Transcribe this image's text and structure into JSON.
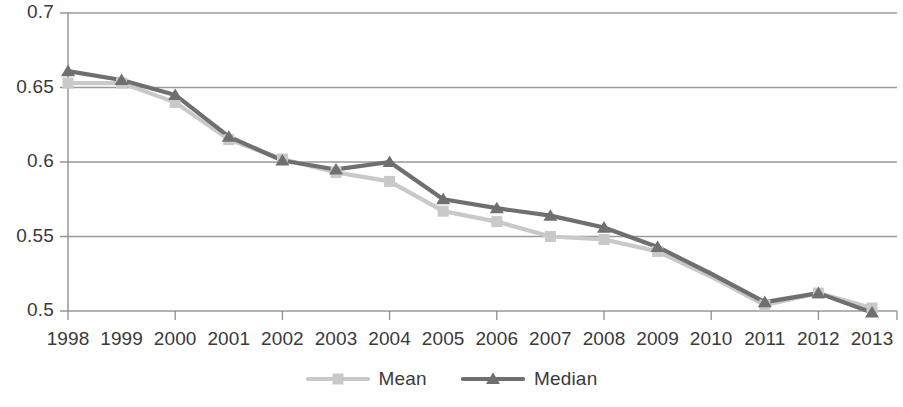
{
  "chart_data": {
    "type": "line",
    "title": "",
    "subtitle": "",
    "xlabel": "",
    "ylabel": "",
    "categories": [
      "1998",
      "1999",
      "2000",
      "2001",
      "2002",
      "2003",
      "2004",
      "2005",
      "2006",
      "2007",
      "2008",
      "2009",
      "2010",
      "2011",
      "2012",
      "2013"
    ],
    "ylim": [
      0.5,
      0.7
    ],
    "ytick_labels": [
      "0.7",
      "0.65",
      "0.6",
      "0.55",
      "0.5"
    ],
    "ytick_values": [
      0.7,
      0.65,
      0.6,
      0.55,
      0.5
    ],
    "grid": true,
    "grid_axis": "y",
    "legend_position": "bottom-center",
    "series": [
      {
        "name": "Mean",
        "color": "#c9c9c9",
        "marker": "square",
        "values": [
          0.653,
          0.653,
          0.64,
          0.615,
          0.602,
          0.593,
          0.587,
          0.567,
          0.56,
          0.55,
          0.548,
          0.54,
          0.523,
          0.504,
          0.512,
          0.502
        ],
        "markers_hidden_at": [
          "2010"
        ]
      },
      {
        "name": "Median",
        "color": "#6f6f6f",
        "marker": "triangle",
        "values": [
          0.661,
          0.655,
          0.645,
          0.617,
          0.601,
          0.595,
          0.6,
          0.575,
          0.569,
          0.564,
          0.556,
          0.543,
          0.525,
          0.506,
          0.512,
          0.499
        ],
        "markers_hidden_at": [
          "2010"
        ]
      }
    ]
  },
  "axis": {
    "y_labels": [
      "0.7",
      "0.65",
      "0.6",
      "0.55",
      "0.5"
    ],
    "x_labels": [
      "1998",
      "1999",
      "2000",
      "2001",
      "2002",
      "2003",
      "2004",
      "2005",
      "2006",
      "2007",
      "2008",
      "2009",
      "2010",
      "2011",
      "2012",
      "2013"
    ]
  },
  "legend": {
    "items": [
      {
        "label": "Mean",
        "color": "#c9c9c9",
        "marker": "square"
      },
      {
        "label": "Median",
        "color": "#6f6f6f",
        "marker": "triangle"
      }
    ]
  },
  "colors": {
    "mean": "#c9c9c9",
    "median": "#6f6f6f",
    "grid": "#9a9a9a",
    "axis": "#8f8f8f",
    "text": "#3a3a3a",
    "background": "#ffffff"
  }
}
